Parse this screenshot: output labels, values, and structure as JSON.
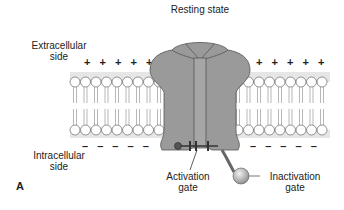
{
  "title": "Resting state",
  "panel_letter": "A",
  "labels": {
    "extracellular": [
      "Extracellular",
      "side"
    ],
    "intracellular": [
      "Intracellular",
      "side"
    ],
    "activation_gate": [
      "Activation",
      "gate"
    ],
    "inactivation_gate": [
      "Inactivation",
      "gate"
    ]
  },
  "charges": {
    "outside_left": "+ + + + +",
    "outside_right": "+ + + + +",
    "inside_left": "– – – – –",
    "inside_right": "– – – – –"
  },
  "colors": {
    "channel": "#9a9a9a",
    "channel_dark": "#7e7e7e",
    "membrane_band": "#e6e6e6",
    "lipid_head": "#ffffff",
    "outline": "#555555"
  }
}
